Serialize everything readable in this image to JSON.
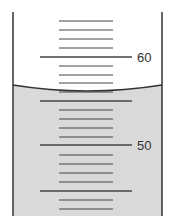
{
  "figure": {
    "type": "graduated-cylinder-reading",
    "labels": [
      {
        "text": "60",
        "value": 60
      },
      {
        "text": "50",
        "value": 50
      }
    ],
    "scale": {
      "major_step": 5,
      "minor_step": 1,
      "visible_range": [
        44,
        64
      ],
      "labeled_values": [
        60,
        50
      ]
    },
    "liquid": {
      "meniscus_reading": 56.1,
      "fill_color": "#d9d9d9"
    },
    "colors": {
      "wall": "#333333",
      "tick": "#444444",
      "background": "#ffffff"
    }
  }
}
